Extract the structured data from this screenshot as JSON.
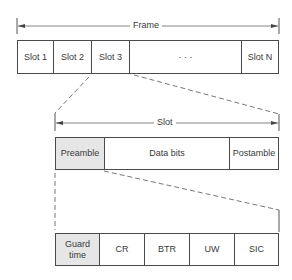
{
  "frame": {
    "label": "Frame",
    "slots": [
      "Slot 1",
      "Slot 2",
      "Slot 3",
      "· · ·",
      "Slot N"
    ]
  },
  "slot": {
    "label": "Slot",
    "parts": [
      "Preamble",
      "Data bits",
      "Postamble"
    ]
  },
  "preamble": {
    "parts": [
      "Guard time",
      "CR",
      "BTR",
      "UW",
      "SIC"
    ]
  }
}
